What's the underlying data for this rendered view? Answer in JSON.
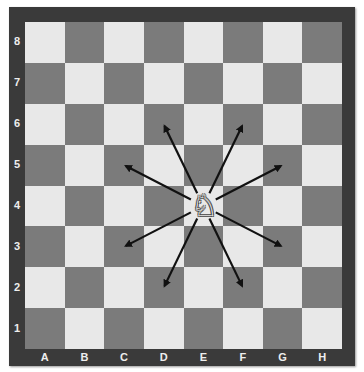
{
  "board": {
    "files": [
      "A",
      "B",
      "C",
      "D",
      "E",
      "F",
      "G",
      "H"
    ],
    "ranks": [
      "8",
      "7",
      "6",
      "5",
      "4",
      "3",
      "2",
      "1"
    ],
    "colors": {
      "light": "#e8e8e8",
      "dark": "#7b7b7b",
      "frame": "#3a3a3a",
      "label": "#eeeeee",
      "arrow": "#111111"
    }
  },
  "piece": {
    "type": "knight",
    "color": "white",
    "square": "E4",
    "glyph": "♘"
  },
  "moves": [
    "D6",
    "F6",
    "C5",
    "G5",
    "C3",
    "G3",
    "D2",
    "F2"
  ]
}
